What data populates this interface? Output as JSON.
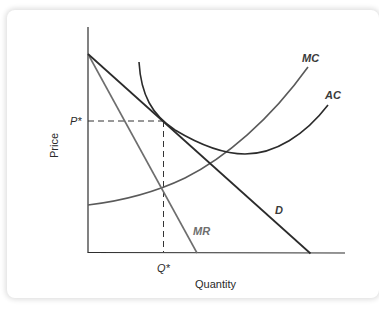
{
  "diagram": {
    "type": "monopolistic-competition-equilibrium",
    "axes": {
      "x_label": "Quantity",
      "y_label": "Price"
    },
    "markers": {
      "price_marker": "P*",
      "quantity_marker": "Q*"
    },
    "curves": [
      {
        "id": "D",
        "label": "D",
        "description": "Demand curve (downward sloping)",
        "color": "#2b2b2b"
      },
      {
        "id": "MR",
        "label": "MR",
        "description": "Marginal revenue (steeper, gray)",
        "color": "#6e6e6e"
      },
      {
        "id": "MC",
        "label": "MC",
        "description": "Marginal cost (upward sloping)",
        "color": "#5a5a5a"
      },
      {
        "id": "AC",
        "label": "AC",
        "description": "Average cost (U-shaped, tangent to D at P*)",
        "color": "#2b2b2b"
      }
    ],
    "annotations": [
      "MR intersects MC at Q*",
      "AC tangent to D at (Q*, P*)"
    ]
  }
}
